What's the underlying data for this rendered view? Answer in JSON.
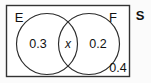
{
  "figure": {
    "type": "venn-diagram",
    "universe_label": "S",
    "set_labels": {
      "left": "E",
      "right": "F"
    },
    "regions": [
      {
        "id": "left-only",
        "label": "0.3",
        "style": "number"
      },
      {
        "id": "intersection",
        "label": "x",
        "style": "variable"
      },
      {
        "id": "right-only",
        "label": "0.2",
        "style": "number"
      },
      {
        "id": "outside-both",
        "label": "0.4",
        "style": "number"
      }
    ],
    "colors": {
      "stroke": "#222222",
      "text": "#111111",
      "background": "#fbfbfb",
      "fill": "#ffffff"
    }
  }
}
